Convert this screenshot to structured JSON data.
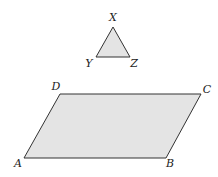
{
  "diagram": {
    "triangle": {
      "vertices": {
        "X": {
          "label": "X",
          "point": [
            113,
            27
          ],
          "label_pos": [
            113,
            21
          ]
        },
        "Y": {
          "label": "Y",
          "point": [
            96,
            57
          ],
          "label_pos": [
            89,
            67
          ]
        },
        "Z": {
          "label": "Z",
          "point": [
            130,
            57
          ],
          "label_pos": [
            134,
            67
          ]
        }
      },
      "fill": "#e4e4e4",
      "stroke": "#333333"
    },
    "parallelogram": {
      "vertices": {
        "A": {
          "label": "A",
          "point": [
            24,
            158
          ],
          "label_pos": [
            18,
            167
          ]
        },
        "B": {
          "label": "B",
          "point": [
            166,
            158
          ],
          "label_pos": [
            170,
            167
          ]
        },
        "C": {
          "label": "C",
          "point": [
            201,
            94
          ],
          "label_pos": [
            207,
            93
          ]
        },
        "D": {
          "label": "D",
          "point": [
            60,
            94
          ],
          "label_pos": [
            56,
            90
          ]
        }
      },
      "fill": "#e4e4e4",
      "stroke": "#333333"
    }
  }
}
